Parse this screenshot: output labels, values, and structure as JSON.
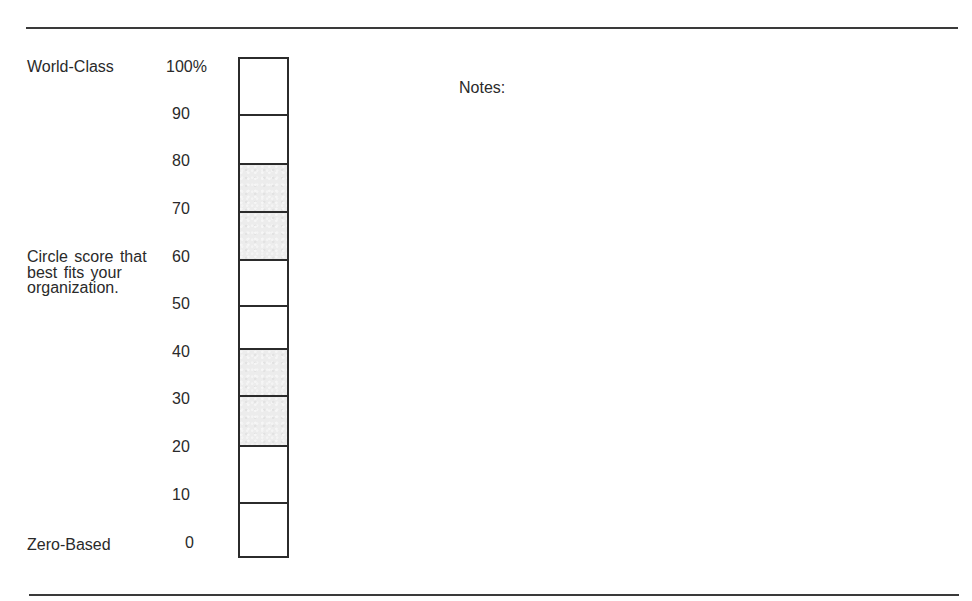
{
  "form": {
    "top_label": "World-Class",
    "bottom_label": "Zero-Based",
    "instruction": "Circle score that best fits your organization.",
    "notes_label": "Notes:"
  },
  "scale": {
    "ticks": [
      "100%",
      "90",
      "80",
      "70",
      "60",
      "50",
      "40",
      "30",
      "20",
      "10",
      "0"
    ],
    "cells": [
      {
        "range": "90-100",
        "shaded": false
      },
      {
        "range": "80-90",
        "shaded": false
      },
      {
        "range": "70-80",
        "shaded": true
      },
      {
        "range": "60-70",
        "shaded": true
      },
      {
        "range": "50-60",
        "shaded": false
      },
      {
        "range": "40-50",
        "shaded": false
      },
      {
        "range": "30-40",
        "shaded": true
      },
      {
        "range": "20-30",
        "shaded": true
      },
      {
        "range": "10-20",
        "shaded": false
      },
      {
        "range": "0-10",
        "shaded": false
      }
    ],
    "shade_color": "#ececec",
    "border_color": "#2b2b2b"
  }
}
